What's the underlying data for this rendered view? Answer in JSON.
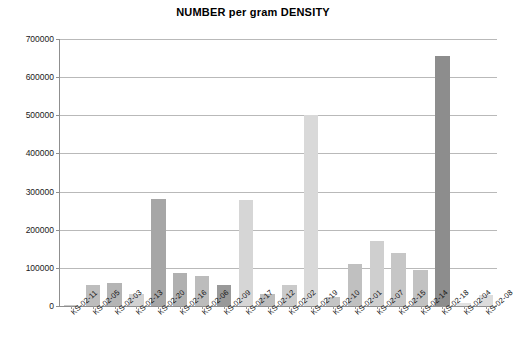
{
  "chart_data": {
    "type": "bar",
    "title": "NUMBER per gram DENSITY",
    "xlabel": "",
    "ylabel": "",
    "ylim": [
      0,
      700000
    ],
    "ytick_labels": [
      "700000",
      "600000",
      "500000",
      "400000",
      "300000",
      "200000",
      "100000",
      "0"
    ],
    "ytick_values": [
      700000,
      600000,
      500000,
      400000,
      300000,
      200000,
      100000,
      0
    ],
    "grid": true,
    "legend": false,
    "categories": [
      "KS-02-11",
      "KS-02-05",
      "KS-02-03",
      "KS-02-13",
      "KS-02-20",
      "KS-02-16",
      "KS-02-06",
      "KS-02-09",
      "KS-02-17",
      "KS-02-12",
      "KS-02-02",
      "KS-02-19",
      "KS-02-10",
      "KS-02-01",
      "KS-02-07",
      "KS-02-15",
      "KS-02-14",
      "KS-02-18",
      "KS-02-04",
      "KS-02-08"
    ],
    "values": [
      2000,
      56000,
      60000,
      32000,
      280000,
      87000,
      78000,
      55000,
      278000,
      32000,
      55000,
      500000,
      24000,
      110000,
      170000,
      140000,
      95000,
      655000,
      8000,
      30000
    ],
    "bar_colors": [
      "#c9c9c9",
      "#bdbdbd",
      "#b4b4b4",
      "#d2d2d2",
      "#a6a6a6",
      "#b0b0b0",
      "#bcbcbc",
      "#999999",
      "#d6d6d6",
      "#bdbdbd",
      "#cacaca",
      "#d9d9d9",
      "#c4c4c4",
      "#c0c0c0",
      "#cfcfcf",
      "#c6c6c6",
      "#c2c2c2",
      "#8d8d8d",
      "#e2e2e2",
      "#dcdcdc"
    ]
  },
  "colors": {
    "background": "#ffffff",
    "gridline": "#b9b9b9",
    "axis": "#8f8f8f",
    "text": "#111111",
    "title": "#000000"
  }
}
